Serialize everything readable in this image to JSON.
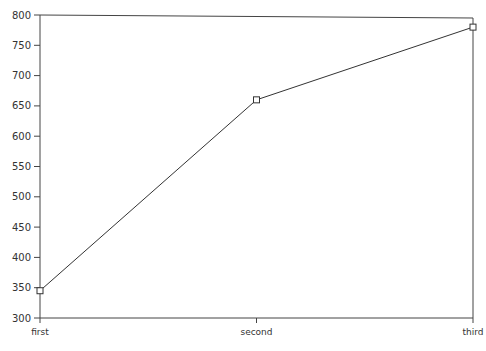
{
  "chart_data": {
    "type": "line",
    "title": "",
    "xlabel": "",
    "ylabel": "",
    "categories": [
      "first",
      "second",
      "third"
    ],
    "series": [
      {
        "name": "series-1",
        "values": [
          345,
          660,
          780
        ],
        "marker": "square",
        "color": "#333333"
      }
    ],
    "ylim": [
      300,
      800
    ],
    "yticks": [
      300,
      350,
      400,
      450,
      500,
      550,
      600,
      650,
      700,
      750,
      800
    ],
    "grid": false,
    "legend": "none"
  }
}
